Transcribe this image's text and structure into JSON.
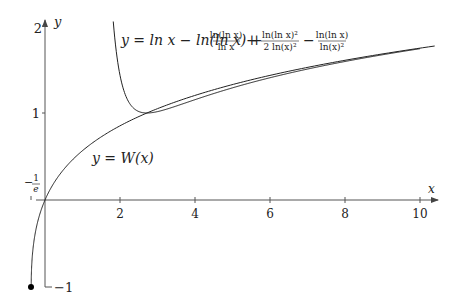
{
  "chart_data": {
    "type": "line",
    "title": "",
    "xlabel": "x",
    "ylabel": "y",
    "xlim": [
      -0.37,
      10.2
    ],
    "ylim": [
      -1,
      2
    ],
    "x_ticks": [
      "2",
      "4",
      "6",
      "8",
      "10"
    ],
    "y_ticks": [
      "-1",
      "1",
      "2"
    ],
    "special_tick": "-1/e",
    "grid": false,
    "series": [
      {
        "name": "y = W(x)",
        "description": "Lambert W principal branch from (-1/e, -1) upward"
      },
      {
        "name": "y = ln x − ln(ln x) + ln(ln x)/ln x + ln(ln x)^2/(2 ln(x)^2) − ln(ln x)/ln(x)^2",
        "description": "asymptotic approximation of W(x)"
      }
    ],
    "annotations": [
      {
        "text": "y = W(x)",
        "x": 1.4,
        "y": 0.6
      },
      {
        "text": "endpoint",
        "x": -0.3679,
        "y": -1,
        "marker": "filled dot"
      }
    ]
  },
  "labels": {
    "y_axis": "y",
    "x_axis": "x",
    "tick_2": "2",
    "tick_4": "4",
    "tick_6": "6",
    "tick_8": "8",
    "tick_10": "10",
    "ytick_1": "1",
    "ytick_2": "2",
    "ytick_m1": "−1",
    "neg_inv_e_num": "1",
    "neg_inv_e_den": "e",
    "wlabel": "y = W(x)",
    "formula_main": "y = ln x − ln(ln x) +",
    "frac1_num": "ln(ln x)",
    "frac1_den": "ln x",
    "frac2_num": "ln(ln x)²",
    "frac2_den": "2 ln(x)²",
    "frac3_num": "ln(ln x)",
    "frac3_den": "ln(x)²",
    "plus": "+",
    "minus": "−"
  }
}
